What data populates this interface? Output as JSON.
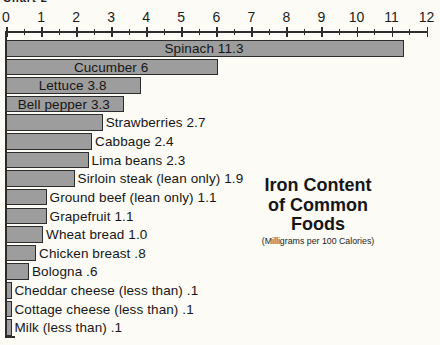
{
  "page_label": "Chart 2",
  "chart_data": {
    "type": "bar",
    "orientation": "horizontal",
    "title": "Iron Content of Common Foods",
    "title_lines": [
      "Iron Content",
      "of Common",
      "Foods"
    ],
    "subtitle": "(Milligrams per 100 Calories)",
    "xlabel": "",
    "ylabel": "",
    "legend": "none",
    "axis": {
      "position": "top",
      "min": 0,
      "max": 12,
      "major_tick_step": 1,
      "minor_tick_step": 0.5,
      "tick_labels": [
        "0",
        "1",
        "2",
        "3",
        "4",
        "5",
        "6",
        "7",
        "8",
        "9",
        "10",
        "11",
        "12"
      ]
    },
    "bars": [
      {
        "label": "Spinach",
        "value": 11.3,
        "display": "Spinach 11.3",
        "label_position": "inside"
      },
      {
        "label": "Cucumber",
        "value": 6,
        "display": "Cucumber 6",
        "label_position": "inside"
      },
      {
        "label": "Lettuce",
        "value": 3.8,
        "display": "Lettuce 3.8",
        "label_position": "inside"
      },
      {
        "label": "Bell pepper",
        "value": 3.3,
        "display": "Bell pepper 3.3",
        "label_position": "inside"
      },
      {
        "label": "Strawberries",
        "value": 2.7,
        "display": "Strawberries 2.7",
        "label_position": "outside"
      },
      {
        "label": "Cabbage",
        "value": 2.4,
        "display": "Cabbage 2.4",
        "label_position": "outside"
      },
      {
        "label": "Lima beans",
        "value": 2.3,
        "display": "Lima beans 2.3",
        "label_position": "outside"
      },
      {
        "label": "Sirloin steak (lean only)",
        "value": 1.9,
        "display": "Sirloin steak (lean only) 1.9",
        "label_position": "outside"
      },
      {
        "label": "Ground beef (lean only)",
        "value": 1.1,
        "display": "Ground beef (lean only) 1.1",
        "label_position": "outside"
      },
      {
        "label": "Grapefruit",
        "value": 1.1,
        "display": "Grapefruit 1.1",
        "label_position": "outside"
      },
      {
        "label": "Wheat bread",
        "value": 1.0,
        "display": "Wheat bread 1.0",
        "label_position": "outside"
      },
      {
        "label": "Chicken breast",
        "value": 0.8,
        "display": "Chicken breast .8",
        "label_position": "outside"
      },
      {
        "label": "Bologna",
        "value": 0.6,
        "display": "Bologna .6",
        "label_position": "outside"
      },
      {
        "label": "Cheddar cheese (less than)",
        "value": 0.1,
        "display": "Cheddar cheese (less than) .1",
        "label_position": "outside"
      },
      {
        "label": "Cottage cheese (less than)",
        "value": 0.1,
        "display": "Cottage cheese (less than) .1",
        "label_position": "outside"
      },
      {
        "label": "Milk (less than)",
        "value": 0.1,
        "display": "Milk (less than) .1",
        "label_position": "outside"
      }
    ],
    "colors": {
      "bar_fill": "#9d9d9d",
      "bar_border": "#2d2d2d",
      "text": "#1d1d1d",
      "background": "#fcfbf6"
    }
  }
}
